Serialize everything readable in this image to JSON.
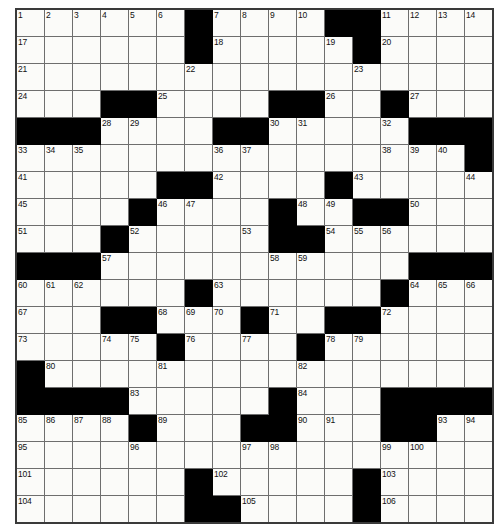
{
  "puzzle": {
    "kind": "crossword-grid",
    "rows": 18,
    "cols": 17,
    "colors": {
      "block": "#000000",
      "cell": "#fbfbf9",
      "gridline": "#6e6e6e",
      "border": "#3a3a3a",
      "number_text": "#111111"
    },
    "max_clue_number": 106,
    "grid": [
      {
        "row": 0,
        "blocks": [
          6,
          11,
          12
        ],
        "numbers": {
          "0": "1",
          "1": "2",
          "2": "3",
          "3": "4",
          "4": "5",
          "5": "6",
          "7": "7",
          "8": "8",
          "9": "9",
          "10": "10",
          "13": "11",
          "14": "12",
          "15": "13",
          "16": "14"
        }
      },
      {
        "row": 1,
        "blocks": [
          6,
          12
        ],
        "numbers": {
          "0": "17",
          "7": "18",
          "11": "19",
          "13": "20"
        }
      },
      {
        "row": 2,
        "blocks": [],
        "numbers": {
          "0": "21",
          "6": "22",
          "12": "23"
        }
      },
      {
        "row": 3,
        "blocks": [
          3,
          4,
          9,
          10,
          13
        ],
        "numbers": {
          "0": "24",
          "5": "25",
          "11": "26",
          "14": "27"
        }
      },
      {
        "row": 4,
        "blocks": [
          0,
          1,
          2,
          7,
          8,
          14,
          15,
          16
        ],
        "numbers": {
          "3": "28",
          "4": "29",
          "9": "30",
          "10": "31",
          "13": "32"
        }
      },
      {
        "row": 5,
        "blocks": [
          16
        ],
        "numbers": {
          "0": "33",
          "1": "34",
          "2": "35",
          "7": "36",
          "8": "37",
          "13": "38",
          "14": "39",
          "15": "40"
        }
      },
      {
        "row": 6,
        "blocks": [
          5,
          6,
          11
        ],
        "numbers": {
          "0": "41",
          "7": "42",
          "12": "43",
          "16": "44"
        }
      },
      {
        "row": 7,
        "blocks": [
          4,
          9,
          12,
          13
        ],
        "numbers": {
          "0": "45",
          "5": "46",
          "6": "47",
          "10": "48",
          "11": "49",
          "14": "50"
        }
      },
      {
        "row": 8,
        "blocks": [
          3,
          9,
          10
        ],
        "numbers": {
          "0": "51",
          "4": "52",
          "8": "53",
          "11": "54",
          "12": "55",
          "13": "56"
        }
      },
      {
        "row": 9,
        "blocks": [
          0,
          1,
          2,
          14,
          15,
          16
        ],
        "numbers": {
          "3": "57",
          "9": "58",
          "10": "59"
        }
      },
      {
        "row": 10,
        "blocks": [
          6,
          13
        ],
        "numbers": {
          "0": "60",
          "1": "61",
          "2": "62",
          "7": "63",
          "14": "64",
          "15": "65",
          "16": "66"
        }
      },
      {
        "row": 11,
        "blocks": [
          3,
          4,
          8,
          11,
          12
        ],
        "numbers": {
          "0": "67",
          "5": "68",
          "6": "69",
          "7": "70",
          "9": "71",
          "13": "72"
        }
      },
      {
        "row": 12,
        "blocks": [
          5,
          10
        ],
        "numbers": {
          "0": "73",
          "3": "74",
          "4": "75",
          "6": "76",
          "8": "77",
          "11": "78",
          "12": "79"
        }
      },
      {
        "row": 13,
        "blocks": [
          0
        ],
        "numbers": {
          "1": "80",
          "5": "81",
          "10": "82"
        }
      },
      {
        "row": 14,
        "blocks": [
          0,
          1,
          2,
          3,
          9,
          13,
          14,
          15,
          16
        ],
        "numbers": {
          "4": "83",
          "10": "84"
        }
      },
      {
        "row": 15,
        "blocks": [
          4,
          8,
          9,
          13,
          14
        ],
        "numbers": {
          "0": "85",
          "1": "86",
          "2": "87",
          "3": "88",
          "5": "89",
          "10": "90",
          "11": "91",
          "14": "92",
          "15": "93",
          "16": "94"
        }
      },
      {
        "row": 16,
        "blocks": [],
        "numbers": {
          "0": "95",
          "4": "96",
          "8": "97",
          "9": "98",
          "13": "99",
          "14": "100"
        }
      },
      {
        "row": 17,
        "blocks": [
          6,
          12
        ],
        "numbers": {
          "0": "101",
          "7": "102",
          "13": "103"
        }
      },
      {
        "row": 18,
        "blocks": [
          6,
          7,
          12
        ],
        "numbers": {
          "0": "104",
          "8": "105",
          "13": "106"
        }
      }
    ]
  }
}
